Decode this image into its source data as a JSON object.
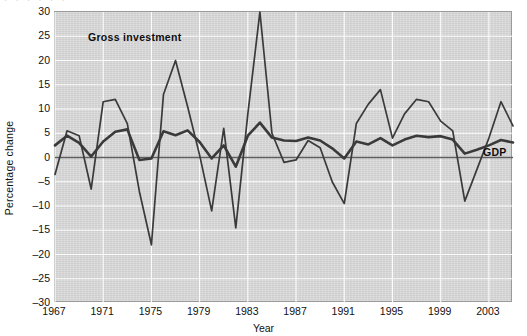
{
  "chart_data": {
    "type": "line",
    "title": "",
    "xlabel": "Year",
    "ylabel": "Percentage change",
    "xlim": [
      1967,
      2005
    ],
    "ylim": [
      -30,
      30
    ],
    "ytick_values": [
      30,
      25,
      20,
      15,
      10,
      5,
      0,
      -5,
      -10,
      -15,
      -20,
      -25,
      -30
    ],
    "ytick_labels": [
      "30",
      "25",
      "20",
      "15",
      "10",
      "5",
      "0",
      "–5",
      "–10",
      "–15",
      "–20",
      "–25",
      "–30"
    ],
    "xtick_values": [
      1967,
      1971,
      1975,
      1979,
      1983,
      1987,
      1991,
      1995,
      1999,
      2003
    ],
    "xtick_labels": [
      "1967",
      "1971",
      "1975",
      "1979",
      "1983",
      "1987",
      "1991",
      "1995",
      "1999",
      "2003"
    ],
    "grid": true,
    "grid_color": "#ffffff",
    "plot_background": "#d9d9d9",
    "line_color": "#3a3a3a",
    "zero_line": 0,
    "legend_position": "inline-annotations",
    "x": [
      1967,
      1968,
      1969,
      1970,
      1971,
      1972,
      1973,
      1974,
      1975,
      1976,
      1977,
      1978,
      1979,
      1980,
      1981,
      1982,
      1983,
      1984,
      1985,
      1986,
      1987,
      1988,
      1989,
      1990,
      1991,
      1992,
      1993,
      1994,
      1995,
      1996,
      1997,
      1998,
      1999,
      2000,
      2001,
      2002,
      2003,
      2004,
      2005
    ],
    "series": [
      {
        "name": "Gross investment",
        "label": "Gross investment",
        "values": [
          -3.5,
          5.5,
          4.5,
          -6.5,
          11.5,
          12.0,
          7.0,
          -7.0,
          -18.0,
          13.0,
          20.0,
          10.5,
          0.5,
          -11.0,
          6.0,
          -14.5,
          9.0,
          30.0,
          5.0,
          -1.0,
          -0.5,
          3.5,
          2.0,
          -5.0,
          -9.5,
          7.0,
          11.0,
          14.0,
          4.0,
          9.0,
          12.0,
          11.5,
          7.5,
          5.5,
          -9.0,
          -2.5,
          4.0,
          11.5,
          6.5
        ]
      },
      {
        "name": "GDP",
        "label": "GDP",
        "values": [
          2.5,
          4.5,
          3.0,
          0.2,
          3.3,
          5.3,
          5.8,
          -0.5,
          -0.2,
          5.4,
          4.6,
          5.6,
          3.2,
          -0.2,
          2.5,
          -1.9,
          4.5,
          7.2,
          4.1,
          3.5,
          3.4,
          4.1,
          3.5,
          1.9,
          -0.2,
          3.3,
          2.7,
          4.0,
          2.5,
          3.7,
          4.5,
          4.2,
          4.4,
          3.7,
          0.8,
          1.6,
          2.5,
          3.6,
          3.1
        ]
      }
    ]
  },
  "annotations": {
    "gross_investment_tag": "Gross investment",
    "gdp_tag": "GDP"
  },
  "header": {
    "cropped_caption": "·  ·   ·    ·     ·      ·"
  }
}
